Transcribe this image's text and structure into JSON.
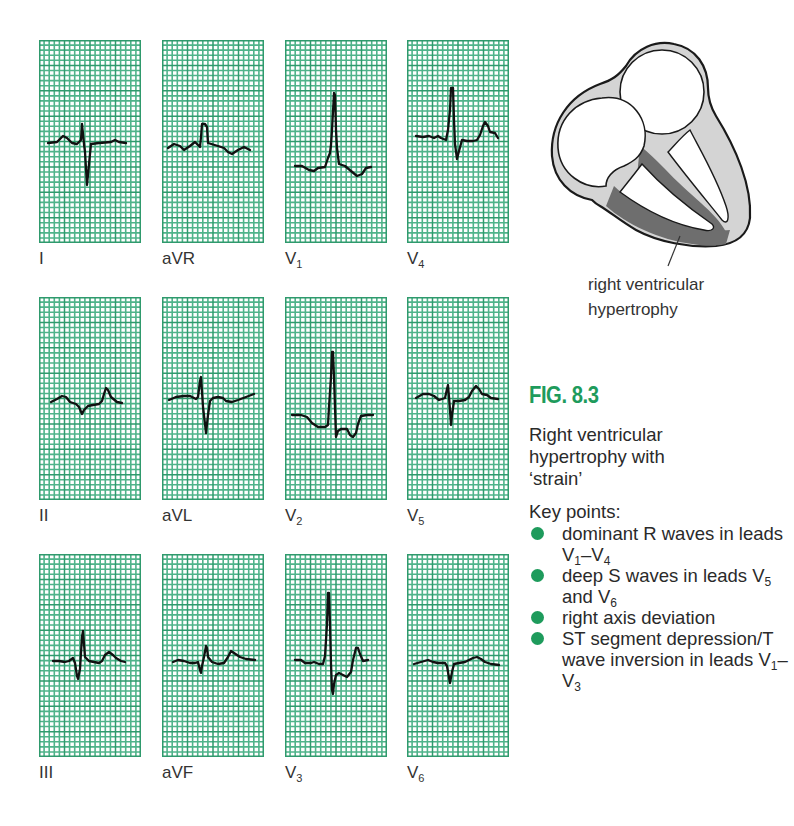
{
  "colors": {
    "grid_major": "#2f9a6d",
    "grid_minor": "#4fb38a",
    "grid_bg": "#ffffff",
    "trace": "#111111",
    "accent": "#1e9b5c",
    "myocardium": "#d4d4d4",
    "hypertrophy": "#6e6e6e"
  },
  "chart_data": {
    "type": "diagram",
    "grid": {
      "major_cols": 4,
      "major_rows": 8,
      "minor_per_major": 5
    },
    "leads": [
      {
        "name": "I",
        "row": 0,
        "col": 0,
        "morphology": "small r, deep S (right axis)"
      },
      {
        "name": "aVR",
        "row": 0,
        "col": 1,
        "morphology": "dominant R"
      },
      {
        "name": "V1",
        "row": 0,
        "col": 2,
        "morphology": "tall dominant R, T inversion"
      },
      {
        "name": "V4",
        "row": 0,
        "col": 3,
        "morphology": "tall R"
      },
      {
        "name": "II",
        "row": 1,
        "col": 0,
        "morphology": "low voltage, small Q"
      },
      {
        "name": "aVL",
        "row": 1,
        "col": 1,
        "morphology": "small r, deep S"
      },
      {
        "name": "V2",
        "row": 1,
        "col": 2,
        "morphology": "tall R, ST depression, T inversion"
      },
      {
        "name": "V5",
        "row": 1,
        "col": 3,
        "morphology": "rS, deep S"
      },
      {
        "name": "III",
        "row": 2,
        "col": 0,
        "morphology": "dominant R"
      },
      {
        "name": "aVF",
        "row": 2,
        "col": 1,
        "morphology": "small qR"
      },
      {
        "name": "V3",
        "row": 2,
        "col": 2,
        "morphology": "tall R, deep S, ST depression"
      },
      {
        "name": "V6",
        "row": 2,
        "col": 3,
        "morphology": "deep S"
      }
    ]
  },
  "ecg": {
    "panels": [
      {
        "label": "I",
        "label_sub": "",
        "trace": "M9,103 L18,102 L24,96 L28,98 L33,103 L38,104 L42,100 L43,84 L45,104 L46,112 L48,145 L50,124 L52,104 L60,103 L72,102 L76,100 L80,102 L87,103"
      },
      {
        "label": "aVR",
        "label_sub": "",
        "trace": "M6,108 L12,104 L18,106 L22,110 L28,106 L33,102 L36,105 L38,107 L39,97 L40,84 L43,84 L45,87 L46,103 L56,106 L62,108 L66,112 L70,114 L76,110 L82,107 L88,110"
      },
      {
        "label": "V",
        "label_sub": "1",
        "trace": "M10,126 L17,126 L24,130 L29,131 L33,128 L40,127 L43,118 L45,113 L46,105 L47,90 L49,53 L50,55 L51,90 L52,108 L54,124 L60,126 L66,131 L72,136 L77,134 L81,128 L86,127"
      },
      {
        "label": "V",
        "label_sub": "4",
        "trace": "M9,96 L16,97 L22,96 L27,98 L31,96 L34,98 L39,100 L41,90 L43,70 L44,48 L46,48 L47,80 L48,104 L50,119 L52,111 L55,100 L60,101 L66,101 L70,100 L73,95 L76,86 L78,82 L81,86 L83,92 L88,93 L91,98"
      },
      {
        "label": "II",
        "label_sub": "",
        "trace": "M12,105 L18,102 L23,99 L27,100 L31,105 L37,107 L40,110 L43,117 L45,113 L49,109 L54,108 L60,107 L63,104 L65,97 L67,91 L69,93 L72,100 L78,105 L83,106"
      },
      {
        "label": "aVL",
        "label_sub": "",
        "trace": "M7,103 L14,100 L22,99 L28,99 L34,102 L36,100 L38,84 L39,80 L40,95 L41,110 L43,127 L44,136 L46,118 L48,104 L51,101 L56,100 L61,101 L64,104 L70,105 L76,103 L84,100 L92,97"
      },
      {
        "label": "V",
        "label_sub": "2",
        "trace": "M7,118 L16,118 L22,120 L27,126 L33,130 L40,130 L43,128 L44,110 L46,80 L47,55 L48,55 L49,80 L50,110 L51,140 L53,134 L56,132 L62,132 L65,138 L68,140 L71,136 L73,127 L76,119 L82,118 L88,118"
      },
      {
        "label": "V",
        "label_sub": "5",
        "trace": "M9,101 L16,97 L22,97 L27,99 L32,103 L38,101 L40,92 L41,88 L42,100 L43,113 L44,128 L45,118 L47,104 L52,104 L58,103 L62,100 L65,94 L69,89 L72,92 L75,97 L80,98 L84,101 L91,102"
      },
      {
        "label": "III",
        "label_sub": "",
        "trace": "M14,107 L20,107 L26,108 L30,107 L34,104 L36,109 L38,122 L39,125 L41,115 L43,83 L44,77 L45,90 L46,103 L50,107 L55,108 L60,109 L63,107 L66,101 L70,98 L74,101 L77,104 L82,107 L86,108"
      },
      {
        "label": "aVF",
        "label_sub": "",
        "trace": "M11,108 L16,106 L22,107 L28,109 L33,109 L36,108 L38,116 L39,119 L40,112 L42,103 L44,92 L45,94 L46,103 L50,108 L56,110 L62,109 L66,103 L69,97 L72,99 L78,103 L84,105 L93,106"
      },
      {
        "label": "V",
        "label_sub": "3",
        "trace": "M10,106 L16,106 L20,109 L26,109 L29,108 L34,110 L38,110 L40,102 L42,70 L43,39 L44,39 L45,70 L46,110 L47,136 L48,140 L49,130 L51,121 L54,119 L58,121 L62,123 L66,118 L68,106 L71,94 L73,94 L75,100 L78,107 L83,106"
      },
      {
        "label": "V",
        "label_sub": "6",
        "trace": "M7,110 L14,108 L21,106 L26,108 L31,109 L38,109 L40,112 L41,118 L43,129 L45,118 L47,110 L52,109 L58,108 L62,106 L66,104 L70,103 L74,105 L78,108 L84,110 L92,111"
      }
    ]
  },
  "heart_diagram": {
    "caption_line1": "right ventricular",
    "caption_line2": "hypertrophy"
  },
  "figure": {
    "title": "FIG. 8.3",
    "description_lines": [
      "Right ventricular",
      "hypertrophy with",
      "‘strain’"
    ],
    "key_points_title": "Key points:",
    "key_points": [
      {
        "parts": [
          "dominant R waves in leads V",
          "1",
          "–V",
          "4",
          ""
        ]
      },
      {
        "parts": [
          "deep S waves in leads V",
          "5",
          " and V",
          "6",
          ""
        ]
      },
      {
        "parts": [
          "right axis deviation",
          "",
          "",
          "",
          ""
        ]
      },
      {
        "parts": [
          "ST segment depression/T wave inversion in leads V",
          "1",
          "–V",
          "3",
          ""
        ]
      }
    ]
  }
}
